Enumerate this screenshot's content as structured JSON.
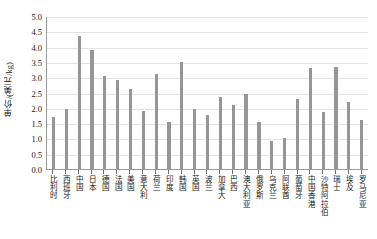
{
  "chart_data": {
    "type": "bar",
    "title": "",
    "xlabel": "",
    "ylabel": "单价/(美元/kg)",
    "ylim": [
      0.0,
      5.0
    ],
    "ytick_labels": [
      "5.0",
      "4.5",
      "4.0",
      "3.5",
      "3.0",
      "2.5",
      "2.0",
      "1.5",
      "1.0",
      "0.5",
      "0.0"
    ],
    "ytick_values": [
      5.0,
      4.5,
      4.0,
      3.5,
      3.0,
      2.5,
      2.0,
      1.5,
      1.0,
      0.5,
      0.0
    ],
    "grid": true,
    "legend": false,
    "bar_color": "#969696",
    "axis_color": "#9a9a9a",
    "gridline_color": "#e3e3e3",
    "categories": [
      "比利时",
      "西班牙",
      "中国",
      "日本",
      "德国",
      "法国",
      "美国",
      "意大利",
      "荷兰",
      "印度",
      "韩国",
      "英国",
      "波兰",
      "加拿大",
      "巴西",
      "澳大利亚",
      "俄罗斯",
      "乌克兰",
      "阿联酋",
      "葡萄牙",
      "中国香港",
      "沙特阿拉伯",
      "瑞士",
      "埃及",
      "罗马尼亚"
    ],
    "values": [
      1.7,
      1.95,
      4.35,
      3.9,
      3.05,
      2.9,
      2.6,
      1.9,
      3.1,
      1.55,
      3.5,
      1.95,
      1.75,
      2.35,
      2.1,
      2.45,
      1.55,
      0.9,
      1.0,
      2.3,
      3.3,
      1.85,
      3.35,
      2.2,
      1.6
    ]
  }
}
